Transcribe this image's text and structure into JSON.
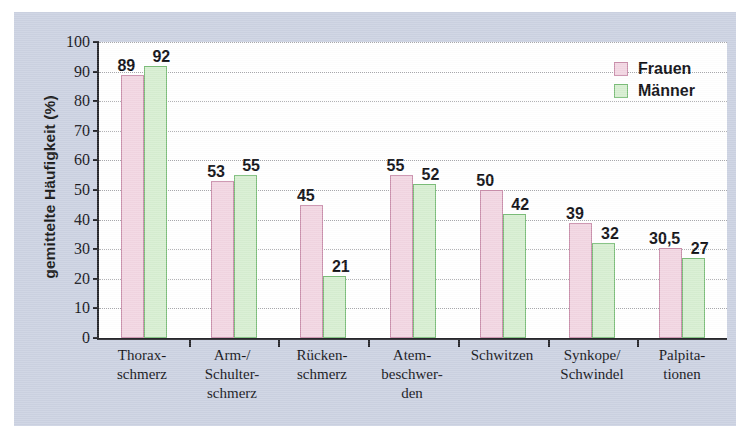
{
  "chart_data": {
    "type": "bar",
    "title": "",
    "xlabel": "",
    "ylabel": "gemittelte Häufigkeit (%)",
    "ylim": [
      0,
      100
    ],
    "yticks": [
      0,
      10,
      20,
      30,
      40,
      50,
      60,
      70,
      80,
      90,
      100
    ],
    "grid": "horizontal-dotted",
    "legend_position": "top-right",
    "categories": [
      "Thorax-\nschmerz",
      "Arm-/\nSchulter-\nschmerz",
      "Rücken-\nschmerz",
      "Atem-\nbeschwer-\nden",
      "Schwitzen",
      "Synkope/\nSchwindel",
      "Palpita-\ntionen"
    ],
    "series": [
      {
        "name": "Frauen",
        "color": "#f2d6e2",
        "border_color": "#c98fab",
        "values": [
          89,
          53,
          45,
          55,
          50,
          39,
          30.5
        ],
        "labels": [
          "89",
          "53",
          "45",
          "55",
          "50",
          "39",
          "30,5"
        ]
      },
      {
        "name": "Männer",
        "color": "#d7eed1",
        "border_color": "#7bbd79",
        "values": [
          92,
          55,
          21,
          52,
          42,
          32,
          27
        ],
        "labels": [
          "92",
          "55",
          "21",
          "52",
          "42",
          "32",
          "27"
        ]
      }
    ]
  },
  "figure": {
    "background_color": "#ccd2e2",
    "plot_background_color": "#ffffff",
    "axis_color": "#26262b",
    "gridline_color": "#a9a9ad"
  }
}
